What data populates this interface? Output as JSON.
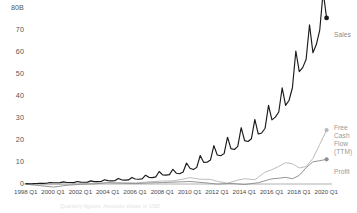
{
  "chart_data": {
    "type": "line",
    "title": "",
    "subtitle": "",
    "xlabel": "",
    "ylabel": "",
    "ylim": [
      0,
      80
    ],
    "xlim": [
      "1998 Q1",
      "2020 Q1"
    ],
    "grid": false,
    "legend_position": "right-inline",
    "y_ticks": [
      "80B",
      "70",
      "60",
      "50",
      "40",
      "30",
      "20",
      "10",
      "0"
    ],
    "y_tick_values": [
      80,
      70,
      60,
      50,
      40,
      30,
      20,
      10,
      0
    ],
    "x_ticks": [
      "1998 Q1",
      "2000 Q1",
      "2002 Q1",
      "2004 Q1",
      "2006 Q1",
      "2008 Q1",
      "2010 Q1",
      "2012 Q1",
      "2014 Q1",
      "2016 Q1",
      "2018 Q1",
      "2020 Q1"
    ],
    "x_tick_values": [
      1998,
      2000,
      2002,
      2004,
      2006,
      2008,
      2010,
      2012,
      2014,
      2016,
      2018,
      2020
    ],
    "x_start": 1998,
    "x_end": 2020.25,
    "colors": {
      "sales": "#1a1a1a",
      "free_cash_flow": "#b8b8b8",
      "profit": "#8f8f8f",
      "axis": "#b0b0b0",
      "tick_text": "#4a4a4a",
      "label_text": "#9a9a9a",
      "footnote_text": "#e2e2e2"
    },
    "series": [
      {
        "name": "Sales",
        "label": "Sales",
        "color": "#1a1a1a",
        "end_marker": true,
        "end_value": 75.5,
        "x": [
          1998.0,
          1998.25,
          1998.5,
          1998.75,
          1999.0,
          1999.25,
          1999.5,
          1999.75,
          2000.0,
          2000.25,
          2000.5,
          2000.75,
          2001.0,
          2001.25,
          2001.5,
          2001.75,
          2002.0,
          2002.25,
          2002.5,
          2002.75,
          2003.0,
          2003.25,
          2003.5,
          2003.75,
          2004.0,
          2004.25,
          2004.5,
          2004.75,
          2005.0,
          2005.25,
          2005.5,
          2005.75,
          2006.0,
          2006.25,
          2006.5,
          2006.75,
          2007.0,
          2007.25,
          2007.5,
          2007.75,
          2008.0,
          2008.25,
          2008.5,
          2008.75,
          2009.0,
          2009.25,
          2009.5,
          2009.75,
          2010.0,
          2010.25,
          2010.5,
          2010.75,
          2011.0,
          2011.25,
          2011.5,
          2011.75,
          2012.0,
          2012.25,
          2012.5,
          2012.75,
          2013.0,
          2013.25,
          2013.5,
          2013.75,
          2014.0,
          2014.25,
          2014.5,
          2014.75,
          2015.0,
          2015.25,
          2015.5,
          2015.75,
          2016.0,
          2016.25,
          2016.5,
          2016.75,
          2017.0,
          2017.25,
          2017.5,
          2017.75,
          2018.0,
          2018.25,
          2018.5,
          2018.75,
          2019.0,
          2019.25,
          2019.5,
          2019.75,
          2020.0
        ],
        "values": [
          0.15,
          0.12,
          0.16,
          0.25,
          0.29,
          0.31,
          0.36,
          0.68,
          0.57,
          0.58,
          0.64,
          0.97,
          0.7,
          0.67,
          0.64,
          1.12,
          0.85,
          0.81,
          0.85,
          1.43,
          1.08,
          1.1,
          1.13,
          1.95,
          1.53,
          1.39,
          1.46,
          2.54,
          1.9,
          1.75,
          1.86,
          2.98,
          2.28,
          2.14,
          2.3,
          3.99,
          3.02,
          2.89,
          3.26,
          5.67,
          4.13,
          4.06,
          4.26,
          6.7,
          4.89,
          4.65,
          5.45,
          9.52,
          7.13,
          6.57,
          7.56,
          12.95,
          9.86,
          9.91,
          10.88,
          17.43,
          13.18,
          12.83,
          13.81,
          21.27,
          16.07,
          15.7,
          17.09,
          25.59,
          19.74,
          19.34,
          20.58,
          29.33,
          22.72,
          23.19,
          25.36,
          35.75,
          29.13,
          30.4,
          32.71,
          43.74,
          35.71,
          37.96,
          43.74,
          60.45,
          51.04,
          52.89,
          56.58,
          72.38,
          59.7,
          63.4,
          69.98,
          87.44,
          75.45
        ]
      },
      {
        "name": "Free Cash Flow (TTM)",
        "label_lines": [
          "Free",
          "Cash",
          "Flow",
          "(TTM)"
        ],
        "color": "#b8b8b8",
        "end_marker": true,
        "end_value": 24.5,
        "x": [
          1998.0,
          1999.0,
          2000.0,
          2001.0,
          2002.0,
          2003.0,
          2004.0,
          2005.0,
          2006.0,
          2007.0,
          2008.0,
          2008.75,
          2009.5,
          2010.0,
          2010.75,
          2011.5,
          2012.0,
          2012.75,
          2013.5,
          2014.0,
          2014.75,
          2015.5,
          2016.0,
          2016.5,
          2017.0,
          2017.5,
          2018.0,
          2018.5,
          2019.0,
          2019.5,
          2020.0
        ],
        "values": [
          -0.03,
          -0.38,
          -0.27,
          -0.12,
          0.14,
          0.35,
          0.48,
          0.53,
          0.49,
          0.98,
          1.36,
          1.4,
          2.2,
          2.92,
          2.16,
          2.1,
          1.2,
          0.39,
          1.75,
          2.38,
          1.95,
          5.4,
          6.5,
          8.0,
          9.7,
          9.2,
          7.3,
          7.9,
          11.6,
          18.0,
          24.5
        ]
      },
      {
        "name": "Profit",
        "label": "Profit",
        "color": "#8f8f8f",
        "end_marker": true,
        "end_value": 11.2,
        "x": [
          1998.0,
          1999.0,
          2000.0,
          2001.0,
          2002.0,
          2003.0,
          2004.0,
          2005.0,
          2006.0,
          2007.0,
          2008.0,
          2009.0,
          2010.0,
          2011.0,
          2012.0,
          2013.0,
          2014.0,
          2015.0,
          2016.0,
          2016.5,
          2017.0,
          2017.5,
          2018.0,
          2018.5,
          2019.0,
          2019.5,
          2020.0
        ],
        "values": [
          -0.12,
          -0.72,
          -1.41,
          -0.57,
          -0.15,
          0.04,
          0.59,
          0.36,
          0.19,
          0.48,
          0.65,
          0.9,
          1.15,
          0.63,
          -0.04,
          0.27,
          -0.24,
          0.6,
          2.37,
          2.6,
          3.03,
          2.4,
          3.9,
          7.4,
          10.07,
          10.6,
          11.2
        ]
      }
    ],
    "annotations": {
      "sales_label": "Sales",
      "fcf_label_full": "Free Cash Flow (TTM)",
      "profit_label": "Profit"
    }
  },
  "legend": {
    "sales": "Sales",
    "fcf_line1": "Free",
    "fcf_line2": "Cash",
    "fcf_line3": "Flow",
    "fcf_line4": "(TTM)",
    "profit": "Profit"
  },
  "footnote": {
    "text": "Quarterly figures. Amounts shown in USD."
  }
}
